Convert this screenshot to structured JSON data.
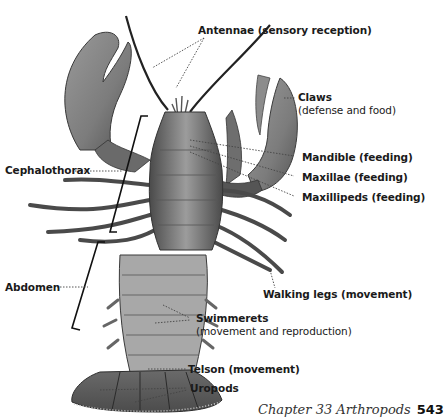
{
  "figure": {
    "labels": {
      "antennae": "Antennae (sensory reception)",
      "claws": "Claws",
      "claws_sub": "(defense and food)",
      "cephalothorax": "Cephalothorax",
      "mandible": "Mandible (feeding)",
      "maxillae": "Maxillae (feeding)",
      "maxillipeds": "Maxillipeds (feeding)",
      "abdomen": "Abdomen",
      "walking_legs": "Walking legs (movement)",
      "swimmerets": "Swimmerets",
      "swimmerets_sub": "(movement and reproduction)",
      "telson": "Telson (movement)",
      "uropods": "Uropods"
    }
  },
  "footer": {
    "chapter": "Chapter 33 Arthropods",
    "page": "543"
  },
  "colors": {
    "body_dark": "#3a3a3a",
    "body_mid": "#7a7a7a",
    "body_light": "#b8b8b8",
    "leader_line": "#444444"
  }
}
